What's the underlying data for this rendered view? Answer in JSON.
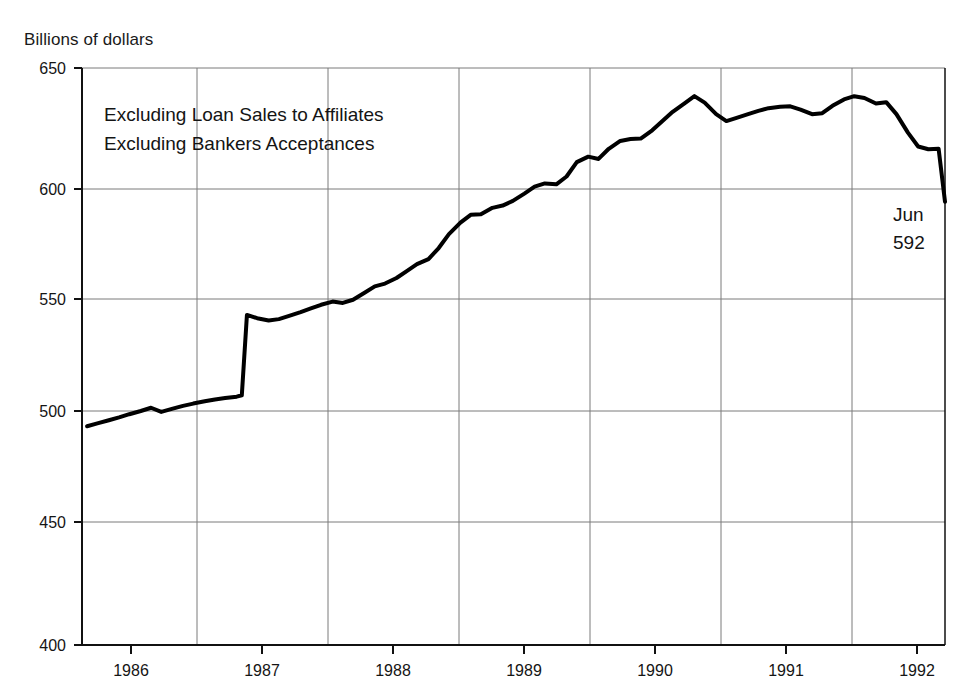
{
  "figure": {
    "clipped_header_text": "",
    "y_axis_title": "Billions of dollars"
  },
  "annotations": {
    "line1": "Excluding Loan Sales to Affiliates",
    "line2": "Excluding Bankers Acceptances",
    "endpoint_label_month": "Jun",
    "endpoint_label_value": "592"
  },
  "chart_data": {
    "type": "line",
    "title": "",
    "subtitle": "",
    "xlabel": "",
    "ylabel": "Billions of dollars",
    "ylim": [
      400,
      650
    ],
    "xlim": [
      1985.75,
      1992.5
    ],
    "ytick_labels": [
      "650",
      "600",
      "550",
      "500",
      "450",
      "400"
    ],
    "yticks": [
      650,
      600,
      550,
      500,
      450,
      400
    ],
    "xtick_labels": [
      "1986",
      "1987",
      "1988",
      "1989",
      "1990",
      "1991",
      "1992"
    ],
    "xticks": [
      1986.5,
      1987.5,
      1988.5,
      1989.5,
      1990.5,
      1991.5,
      1992.5
    ],
    "gridlines_x": [
      1986,
      1987,
      1988,
      1989,
      1990,
      1991,
      1992
    ],
    "grid": true,
    "legend": "none",
    "line_color": "#000000",
    "line_width": 4,
    "annotations": [
      "Excluding Loan Sales to Affiliates",
      "Excluding Bankers Acceptances",
      "Jun 592"
    ],
    "series": [
      {
        "name": "Bank credit",
        "x": [
          1985.79,
          1985.87,
          1985.96,
          1986.04,
          1986.12,
          1986.21,
          1986.29,
          1986.37,
          1986.46,
          1986.54,
          1986.62,
          1986.71,
          1986.79,
          1986.87,
          1986.96,
          1987.0,
          1987.04,
          1987.12,
          1987.21,
          1987.29,
          1987.37,
          1987.46,
          1987.54,
          1987.62,
          1987.71,
          1987.79,
          1987.87,
          1987.96,
          1988.04,
          1988.12,
          1988.21,
          1988.29,
          1988.37,
          1988.46,
          1988.54,
          1988.62,
          1988.71,
          1988.79,
          1988.87,
          1988.96,
          1989.04,
          1989.12,
          1989.21,
          1989.29,
          1989.37,
          1989.46,
          1989.54,
          1989.62,
          1989.71,
          1989.79,
          1989.87,
          1989.96,
          1990.04,
          1990.12,
          1990.21,
          1990.29,
          1990.37,
          1990.46,
          1990.54,
          1990.62,
          1990.71,
          1990.79,
          1990.87,
          1990.96,
          1991.04,
          1991.12,
          1991.21,
          1991.29,
          1991.37,
          1991.46,
          1991.54,
          1991.62,
          1991.71,
          1991.79,
          1991.87,
          1991.96,
          1992.04,
          1992.12,
          1992.21,
          1992.29,
          1992.37,
          1992.45
        ],
        "values": [
          494.8,
          496.0,
          497.4,
          498.6,
          500.0,
          501.4,
          502.8,
          501.0,
          502.4,
          503.6,
          504.6,
          505.6,
          506.4,
          507.0,
          507.6,
          508.2,
          543.0,
          541.6,
          540.6,
          541.2,
          542.6,
          544.2,
          545.8,
          547.4,
          548.8,
          548.2,
          549.6,
          552.6,
          555.4,
          556.6,
          559.0,
          562.0,
          565.0,
          567.2,
          572.0,
          578.0,
          583.0,
          586.4,
          586.6,
          589.4,
          590.4,
          592.4,
          595.6,
          598.6,
          600.0,
          599.6,
          603.0,
          609.2,
          611.6,
          610.6,
          615.0,
          618.4,
          619.2,
          619.4,
          623.0,
          627.0,
          631.0,
          634.6,
          637.8,
          635.0,
          630.0,
          627.0,
          628.4,
          630.0,
          631.4,
          632.6,
          633.2,
          633.4,
          632.0,
          630.0,
          630.4,
          633.6,
          636.4,
          637.8,
          637.0,
          634.6,
          635.2,
          630.0,
          622.0,
          616.0,
          614.8,
          615.0
        ]
      },
      {
        "name": "Bank credit (continued)",
        "x": [
          1992.45,
          1992.5
        ],
        "values": [
          615.0,
          592.0
        ]
      }
    ],
    "series_full_note": "Single continuous monthly series from late 1985 through Jun 1992, ending at 592.",
    "endpoint": {
      "label": "Jun",
      "value": 592
    }
  }
}
